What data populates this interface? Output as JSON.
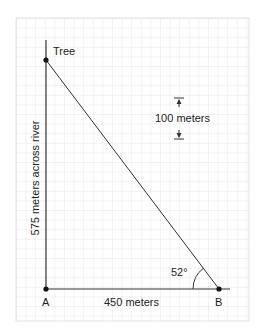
{
  "diagram": {
    "points": {
      "tree": {
        "label": "Tree"
      },
      "a": {
        "label": "A"
      },
      "b": {
        "label": "B"
      }
    },
    "sides": {
      "vertical": {
        "label": "575 meters across river"
      },
      "horizontal": {
        "label": "450 meters"
      }
    },
    "angle": {
      "label": "52°",
      "at": "B"
    },
    "scale": {
      "label": "100 meters"
    },
    "colors": {
      "grid": "#dcdcdc",
      "lines": "#333333",
      "text": "#222222",
      "background": "#ffffff"
    }
  }
}
